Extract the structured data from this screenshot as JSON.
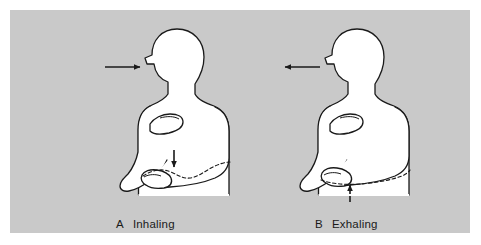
{
  "figure": {
    "type": "anatomical-line-diagram",
    "background_color": "#c9c9c9",
    "page_color": "#ffffff",
    "line_color": "#1a1a1a",
    "body_fill": "#ffffff",
    "panels": [
      {
        "id": "A",
        "letter": "A",
        "label": "Inhaling",
        "airflow_arrow": {
          "direction": "right",
          "meaning": "air moving in toward nose"
        },
        "abdomen_arrow": {
          "direction": "down",
          "meaning": "diaphragm descends, abdomen expands outward"
        },
        "dashed_contour": "expanded abdomen outline",
        "hands": [
          "hand-on-chest",
          "hand-on-abdomen"
        ]
      },
      {
        "id": "B",
        "letter": "B",
        "label": "Exhaling",
        "airflow_arrow": {
          "direction": "left",
          "meaning": "air moving out from mouth"
        },
        "abdomen_arrow": {
          "direction": "up",
          "meaning": "diaphragm rises, abdomen draws inward"
        },
        "dashed_contour": "flattened abdomen outline",
        "hands": [
          "hand-on-chest",
          "hand-on-abdomen"
        ]
      }
    ]
  },
  "captions": {
    "a_letter": "A",
    "a_text": "Inhaling",
    "b_letter": "B",
    "b_text": "Exhaling"
  }
}
